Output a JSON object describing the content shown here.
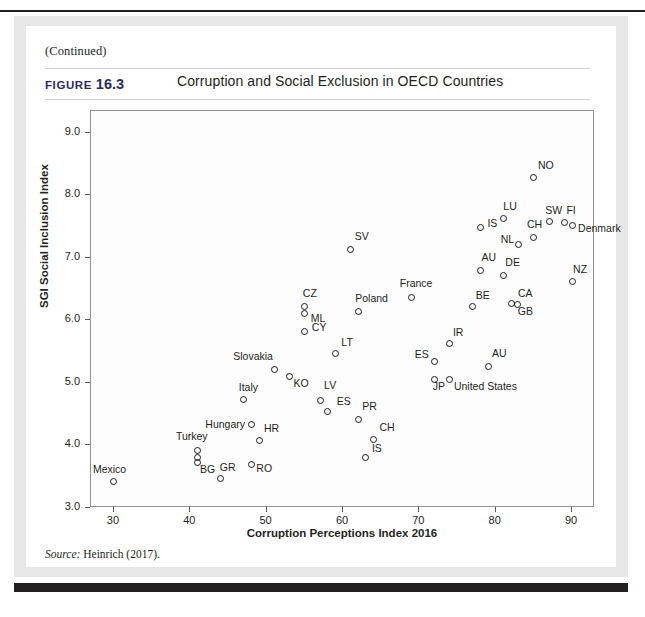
{
  "page": {
    "continued_note": "(Continued)",
    "figure_label": "FIGURE",
    "figure_number": "16.3",
    "source_prefix": "Source:",
    "source_text": "Heinrich (2017)."
  },
  "chart_data": {
    "type": "scatter",
    "title": "Corruption and Social Exclusion in OECD Countries",
    "xlabel": "Corruption Perceptions Index 2016",
    "ylabel": "SGI Social Inclusion Index",
    "xlim": [
      27,
      93
    ],
    "ylim": [
      3.0,
      9.35
    ],
    "xticks": [
      30,
      40,
      50,
      60,
      70,
      80,
      90
    ],
    "xtick_labels": [
      "30",
      "40",
      "50",
      "60",
      "70",
      "80",
      "90"
    ],
    "yticks": [
      3.0,
      4.0,
      5.0,
      6.0,
      7.0,
      8.0,
      9.0
    ],
    "ytick_labels": [
      "3.0",
      "4.0",
      "5.0",
      "6.0",
      "7.0",
      "8.0",
      "9.0"
    ],
    "grid": false,
    "legend": "none",
    "marker": "open-circle",
    "marker_color": "#1c1c1c",
    "points": [
      {
        "label": "Mexico",
        "x": 30,
        "y": 3.42,
        "lx": -21,
        "ly": -14
      },
      {
        "label": "Turkey",
        "x": 41,
        "y": 3.92,
        "lx": -22,
        "ly": -15
      },
      {
        "label": "",
        "x": 41,
        "y": 3.8,
        "lx": 0,
        "ly": 0
      },
      {
        "label": "BG",
        "x": 41,
        "y": 3.72,
        "lx": 2,
        "ly": 5
      },
      {
        "label": "GR",
        "x": 44,
        "y": 3.47,
        "lx": -1,
        "ly": -13
      },
      {
        "label": "RO",
        "x": 48,
        "y": 3.7,
        "lx": 5,
        "ly": 3
      },
      {
        "label": "HR",
        "x": 49,
        "y": 4.08,
        "lx": 5,
        "ly": -13
      },
      {
        "label": "Hungary",
        "x": 48,
        "y": 4.33,
        "lx": -46,
        "ly": -2
      },
      {
        "label": "Italy",
        "x": 47,
        "y": 4.73,
        "lx": -5,
        "ly": -14
      },
      {
        "label": "Slovakia",
        "x": 51,
        "y": 5.22,
        "lx": -41,
        "ly": -14
      },
      {
        "label": "KO",
        "x": 53,
        "y": 5.1,
        "lx": 4,
        "ly": 5
      },
      {
        "label": "CZ",
        "x": 55,
        "y": 6.23,
        "lx": -2,
        "ly": -14
      },
      {
        "label": "ML",
        "x": 55,
        "y": 6.11,
        "lx": 6,
        "ly": 3
      },
      {
        "label": "CY",
        "x": 55,
        "y": 5.83,
        "lx": 7,
        "ly": -5
      },
      {
        "label": "LT",
        "x": 59,
        "y": 5.47,
        "lx": 6,
        "ly": -13
      },
      {
        "label": "LV",
        "x": 57,
        "y": 4.72,
        "lx": 4,
        "ly": -16
      },
      {
        "label": "ES",
        "x": 58,
        "y": 4.55,
        "lx": 9,
        "ly": -11
      },
      {
        "label": "PR",
        "x": 62,
        "y": 4.42,
        "lx": 4,
        "ly": -14
      },
      {
        "label": "IS",
        "x": 63,
        "y": 3.8,
        "lx": 6,
        "ly": -11
      },
      {
        "label": "CH",
        "x": 64,
        "y": 4.1,
        "lx": 6,
        "ly": -13
      },
      {
        "label": "SV",
        "x": 61,
        "y": 7.13,
        "lx": 4,
        "ly": -15
      },
      {
        "label": "Poland",
        "x": 62,
        "y": 6.15,
        "lx": -3,
        "ly": -14
      },
      {
        "label": "France",
        "x": 69,
        "y": 6.37,
        "lx": -12,
        "ly": -15
      },
      {
        "label": "ES",
        "x": 72,
        "y": 5.35,
        "lx": -20,
        "ly": -8
      },
      {
        "label": "IR",
        "x": 74,
        "y": 5.63,
        "lx": 3,
        "ly": -13
      },
      {
        "label": "JP",
        "x": 72,
        "y": 5.05,
        "lx": -2,
        "ly": 5
      },
      {
        "label": "United States",
        "x": 74,
        "y": 5.05,
        "lx": 4,
        "ly": 5
      },
      {
        "label": "AU",
        "x": 79,
        "y": 5.27,
        "lx": 4,
        "ly": -14
      },
      {
        "label": "BE",
        "x": 77,
        "y": 6.22,
        "lx": 3,
        "ly": -13
      },
      {
        "label": "CA",
        "x": 82,
        "y": 6.27,
        "lx": 7,
        "ly": -12
      },
      {
        "label": "GB",
        "x": 82.9,
        "y": 6.25,
        "lx": 0,
        "ly": 5
      },
      {
        "label": "DE",
        "x": 81,
        "y": 6.72,
        "lx": 2,
        "ly": -14
      },
      {
        "label": "AU",
        "x": 78,
        "y": 6.8,
        "lx": 1,
        "ly": -14
      },
      {
        "label": "NL",
        "x": 83,
        "y": 7.22,
        "lx": -18,
        "ly": -6
      },
      {
        "label": "IS",
        "x": 78,
        "y": 7.48,
        "lx": 7,
        "ly": -6
      },
      {
        "label": "LU",
        "x": 81,
        "y": 7.63,
        "lx": 0,
        "ly": -14
      },
      {
        "label": "CH",
        "x": 85,
        "y": 7.33,
        "lx": -7,
        "ly": -14
      },
      {
        "label": "SW",
        "x": 87,
        "y": 7.58,
        "lx": -4,
        "ly": -13
      },
      {
        "label": "FI",
        "x": 89,
        "y": 7.57,
        "lx": 2,
        "ly": -13
      },
      {
        "label": "Denmark",
        "x": 90,
        "y": 7.52,
        "lx": 6,
        "ly": 2
      },
      {
        "label": "NO",
        "x": 85,
        "y": 8.28,
        "lx": 4,
        "ly": -14
      },
      {
        "label": "NZ",
        "x": 90,
        "y": 6.62,
        "lx": 1,
        "ly": -14
      }
    ]
  }
}
